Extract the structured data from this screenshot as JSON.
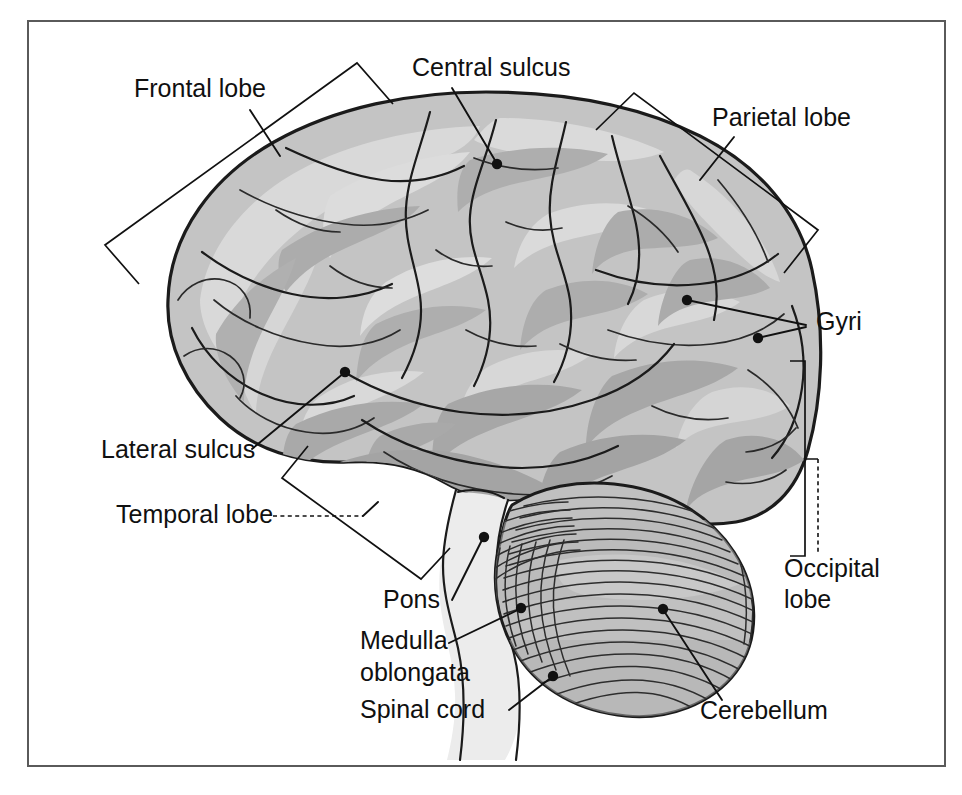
{
  "figure": {
    "frame": {
      "visible": true,
      "color": "#5a5a5a"
    }
  },
  "colors": {
    "background": "#ffffff",
    "cortex_fill": "#c4c4c4",
    "cortex_light": "#d8d8d8",
    "cortex_dark": "#ababab",
    "cerebellum_fill": "#c0c0c0",
    "brainstem_fill": "#ececec",
    "outline": "#1b1b1b",
    "label_text": "#101010",
    "leader_line": "#111111"
  },
  "labels": [
    {
      "id": "frontal-lobe",
      "text": "Frontal lobe",
      "lines": [
        "Frontal lobe"
      ],
      "x": 134,
      "y": 97,
      "anchor": "start",
      "leader": "line",
      "marker": "bracket"
    },
    {
      "id": "central-sulcus",
      "text": "Central sulcus",
      "lines": [
        "Central sulcus"
      ],
      "x": 412,
      "y": 76,
      "anchor": "start",
      "leader": "line",
      "marker": "dot"
    },
    {
      "id": "parietal-lobe",
      "text": "Parietal lobe",
      "lines": [
        "Parietal lobe"
      ],
      "x": 712,
      "y": 126,
      "anchor": "start",
      "leader": "line",
      "marker": "bracket"
    },
    {
      "id": "gyri",
      "text": "Gyri",
      "lines": [
        "Gyri"
      ],
      "x": 816,
      "y": 330,
      "anchor": "start",
      "leader": "line",
      "marker": "dot"
    },
    {
      "id": "lateral-sulcus",
      "text": "Lateral sulcus",
      "lines": [
        "Lateral sulcus"
      ],
      "x": 101,
      "y": 458,
      "anchor": "start",
      "leader": "line",
      "marker": "dot"
    },
    {
      "id": "temporal-lobe",
      "text": "Temporal lobe",
      "lines": [
        "Temporal lobe"
      ],
      "x": 116,
      "y": 523,
      "anchor": "start",
      "leader": "dashed",
      "marker": "bracket"
    },
    {
      "id": "occipital-lobe",
      "text": "Occipital lobe",
      "lines": [
        "Occipital",
        "lobe"
      ],
      "x": 784,
      "y": 577,
      "anchor": "start",
      "leader": "dashed",
      "marker": "bracket"
    },
    {
      "id": "pons",
      "text": "Pons",
      "lines": [
        "Pons"
      ],
      "x": 383,
      "y": 608,
      "anchor": "start",
      "leader": "line",
      "marker": "dot"
    },
    {
      "id": "medulla-oblongata",
      "text": "Medulla oblongata",
      "lines": [
        "Medulla",
        "oblongata"
      ],
      "x": 360,
      "y": 649,
      "anchor": "start",
      "leader": "line",
      "marker": "dot"
    },
    {
      "id": "spinal-cord",
      "text": "Spinal cord",
      "lines": [
        "Spinal cord"
      ],
      "x": 360,
      "y": 718,
      "anchor": "start",
      "leader": "line",
      "marker": "dot"
    },
    {
      "id": "cerebellum",
      "text": "Cerebellum",
      "lines": [
        "Cerebellum"
      ],
      "x": 700,
      "y": 719,
      "anchor": "start",
      "leader": "line",
      "marker": "dot"
    }
  ],
  "structures": [
    {
      "id": "cerebrum",
      "name": "Cerebrum"
    },
    {
      "id": "cerebellum",
      "name": "Cerebellum"
    },
    {
      "id": "brainstem",
      "name": "Brainstem"
    }
  ]
}
